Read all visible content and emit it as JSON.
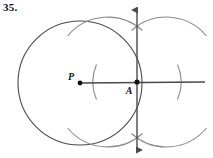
{
  "figure": {
    "problem_number": "35.",
    "caption_visible_text": "35.",
    "background_color": "#ffffff",
    "ink_color": "#4a4a4a",
    "label_color": "#111111",
    "points": [
      {
        "id": "P",
        "label": "P",
        "role": "circle-center",
        "x": 80,
        "y": 83,
        "label_x": 71,
        "label_y": 80,
        "dot_radius": 2.4
      },
      {
        "id": "A",
        "label": "A",
        "role": "tangent-point",
        "x": 137,
        "y": 82,
        "label_x": 129,
        "label_y": 94,
        "dot_radius": 2.6
      }
    ],
    "circle": {
      "name": "circle-P",
      "center_x": 80,
      "center_y": 83,
      "radius": 62,
      "stroke_width": 1.1
    },
    "lines": [
      {
        "name": "horizontal-line",
        "x1": 80,
        "y1": 83,
        "x2": 205,
        "y2": 82,
        "arrow_start": false,
        "arrow_end": false,
        "stroke_width": 1.4
      },
      {
        "name": "vertical-tangent-line",
        "x1": 137,
        "y1": 8,
        "x2": 137,
        "y2": 152,
        "arrow_start": true,
        "arrow_end": true,
        "stroke_width": 1.4
      }
    ],
    "construction_arcs": [
      {
        "name": "arc-left-of-A",
        "center_x": 137,
        "center_y": 82,
        "radius": 44,
        "start_deg": 155,
        "end_deg": 205,
        "opens": "right"
      },
      {
        "name": "arc-right-of-A",
        "center_x": 137,
        "center_y": 82,
        "radius": 44,
        "start_deg": -25,
        "end_deg": 25,
        "opens": "left"
      },
      {
        "name": "arc-upper-left",
        "center_x": 93,
        "center_y": 82,
        "radius": 52,
        "start_deg": -60,
        "end_deg": -18,
        "opens": "down"
      },
      {
        "name": "arc-upper-right",
        "center_x": 181,
        "center_y": 82,
        "radius": 52,
        "start_deg": -162,
        "end_deg": -120,
        "opens": "down"
      },
      {
        "name": "arc-lower-left",
        "center_x": 93,
        "center_y": 82,
        "radius": 52,
        "start_deg": 18,
        "end_deg": 60,
        "opens": "up"
      },
      {
        "name": "arc-lower-right",
        "center_x": 181,
        "center_y": 82,
        "radius": 52,
        "start_deg": 120,
        "end_deg": 162,
        "opens": "up"
      }
    ],
    "arc_intersections": [
      {
        "name": "upper-intersection",
        "x": 137,
        "y": 30
      },
      {
        "name": "lower-intersection",
        "x": 137,
        "y": 134
      }
    ]
  }
}
